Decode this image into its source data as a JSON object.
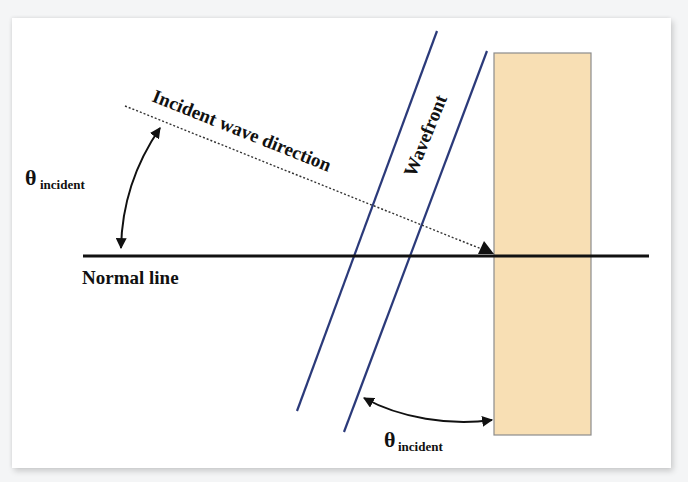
{
  "diagram": {
    "labels": {
      "incident_direction": "Incident wave direction",
      "wavefront": "Wavefront",
      "normal_line": "Normal line",
      "theta_symbol": "θ",
      "theta_subscript": "incident"
    },
    "colors": {
      "wavefront": "#2b3a7a",
      "barrier_fill": "#f8dfb4",
      "barrier_border": "#8c8c8c",
      "lines": "#111111",
      "background": "#ffffff"
    },
    "elements": {
      "normal_line": {
        "x1": 83,
        "y1": 256,
        "x2": 649,
        "y2": 256
      },
      "incident_ray": {
        "x1": 125,
        "y1": 106,
        "x2": 494,
        "y2": 254
      },
      "wavefront_lines": [
        {
          "x1": 437,
          "y1": 31,
          "x2": 297,
          "y2": 411
        },
        {
          "x1": 487,
          "y1": 51,
          "x2": 344,
          "y2": 432
        }
      ],
      "barrier": {
        "x": 494,
        "y": 53,
        "width": 97,
        "height": 382
      }
    }
  }
}
